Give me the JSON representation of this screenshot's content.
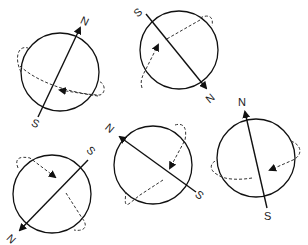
{
  "diagram": {
    "globes": [
      {
        "id": 1,
        "north_label": "N",
        "south_label": "S"
      },
      {
        "id": 2,
        "north_label": "N",
        "south_label": "S"
      },
      {
        "id": 3,
        "north_label": "N",
        "south_label": "S"
      },
      {
        "id": 4,
        "north_label": "N",
        "south_label": "S"
      },
      {
        "id": 5,
        "north_label": "N",
        "south_label": "S"
      }
    ]
  }
}
